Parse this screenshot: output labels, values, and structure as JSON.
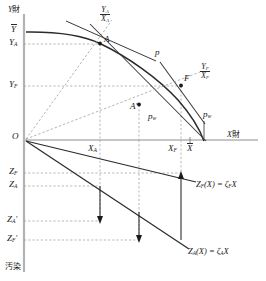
{
  "figure": {
    "title_axes": {
      "y_axis_label": "Y財",
      "x_axis_label": "X財",
      "lower_axis_label": "汚染"
    },
    "origin_label": "O",
    "upper_panel": {
      "y_ticks": [
        {
          "id": "Ybar",
          "base": "Y",
          "bar": true,
          "sub": "",
          "y_px": 31
        },
        {
          "id": "YA",
          "base": "Y",
          "bar": false,
          "sub": "A",
          "y_px": 44
        },
        {
          "id": "YF",
          "base": "Y",
          "bar": false,
          "sub": "F",
          "y_px": 86
        }
      ],
      "x_ticks": [
        {
          "id": "XA",
          "base": "X",
          "bar": false,
          "sub": "A",
          "x_px": 92
        },
        {
          "id": "XF",
          "base": "X",
          "bar": false,
          "sub": "F",
          "x_px": 173
        },
        {
          "id": "Xbar",
          "base": "X",
          "bar": true,
          "sub": "",
          "x_px": 190
        }
      ],
      "points": [
        {
          "name": "A",
          "label": "A",
          "x_px": 100,
          "y_px": 40
        },
        {
          "name": "F",
          "label": "F",
          "x_px": 181,
          "y_px": 82
        },
        {
          "name": "A-prime",
          "label": "A'",
          "x_px": 139,
          "y_px": 105
        }
      ],
      "price_lines": [
        {
          "name": "p",
          "label": "p",
          "x_px": 158,
          "y_px": 54
        },
        {
          "name": "pw-at-Aprime",
          "label": "pw",
          "x_px": 153,
          "y_px": 117
        },
        {
          "name": "pw-at-F",
          "label": "pw",
          "x_px": 207,
          "y_px": 115
        }
      ],
      "rays": [
        {
          "name": "ray-A",
          "num": "YA",
          "den": "XA",
          "x_px": 103,
          "y_px": 8
        },
        {
          "name": "ray-F",
          "num": "YF",
          "den": "XF",
          "x_px": 202,
          "y_px": 66
        }
      ]
    },
    "lower_panel": {
      "z_ticks": [
        {
          "id": "ZF",
          "base": "Z",
          "sub": "F",
          "prime": false,
          "y_px": 173
        },
        {
          "id": "ZA",
          "base": "Z",
          "sub": "A",
          "prime": false,
          "y_px": 186
        },
        {
          "id": "ZAp",
          "base": "Z",
          "sub": "A",
          "prime": true,
          "y_px": 221
        },
        {
          "id": "ZFp",
          "base": "Z",
          "sub": "F",
          "prime": true,
          "y_px": 240
        }
      ],
      "lines": [
        {
          "name": "ZF-line",
          "fn": "Z",
          "fn_sub": "F",
          "arg": "(X)",
          "eq": "=",
          "coef": "ζ",
          "coef_sub": "F",
          "var": "X",
          "x_px": 197,
          "y_px": 185
        },
        {
          "name": "ZA-line",
          "fn": "Z",
          "fn_sub": "A",
          "arg": "(X)",
          "eq": "=",
          "coef": "ζ",
          "coef_sub": "A",
          "var": "X",
          "x_px": 189,
          "y_px": 252
        }
      ]
    },
    "colors": {
      "ink": "#1a1a1a",
      "curve": "#2b2b2b",
      "dashed": "#8c8c8c",
      "axis": "#aaaaaa"
    }
  }
}
